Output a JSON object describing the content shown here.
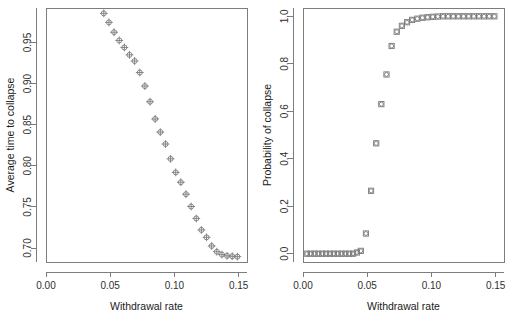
{
  "figure": {
    "name": "two-panel-scatter-figure",
    "background": "#ffffff",
    "marker_color": "#7a7a7a",
    "axis_color": "#7d7d7d",
    "text_color": "#1a1a1a"
  },
  "panels": [
    {
      "id": "left",
      "name": "average-time-to-collapse-panel",
      "xlabel": "Withdrawal rate",
      "ylabel": "Average time to collapse",
      "xticks": [
        "0.00",
        "0.05",
        "0.10",
        "0.15"
      ],
      "yticks": [
        "0.70",
        "0.75",
        "0.80",
        "0.85",
        "0.90",
        "0.95"
      ]
    },
    {
      "id": "right",
      "name": "probability-of-collapse-panel",
      "xlabel": "Withdrawal rate",
      "ylabel": "Probability of collapse",
      "xticks": [
        "0.00",
        "0.05",
        "0.10",
        "0.15"
      ],
      "yticks": [
        "0.0",
        "0.2",
        "0.4",
        "0.6",
        "0.8",
        "1.0"
      ]
    }
  ],
  "chart_data": [
    {
      "type": "scatter",
      "panel": "left",
      "title": "",
      "xlabel": "Withdrawal rate",
      "ylabel": "Average time to collapse",
      "xlim": [
        0.0,
        0.1565
      ],
      "ylim": [
        0.683,
        0.992
      ],
      "xticks": [
        0.0,
        0.05,
        0.1,
        0.15
      ],
      "yticks": [
        0.7,
        0.75,
        0.8,
        0.85,
        0.9,
        0.95
      ],
      "xtick_labels": [
        "0.00",
        "0.05",
        "0.10",
        "0.15"
      ],
      "ytick_labels": [
        "0.70",
        "0.75",
        "0.80",
        "0.85",
        "0.90",
        "0.95"
      ],
      "grid": false,
      "legend": null,
      "marker": "circle-plus",
      "x": [
        0.045,
        0.049,
        0.053,
        0.057,
        0.061,
        0.065,
        0.069,
        0.073,
        0.077,
        0.081,
        0.085,
        0.089,
        0.093,
        0.097,
        0.101,
        0.105,
        0.109,
        0.113,
        0.117,
        0.121,
        0.125,
        0.129,
        0.133,
        0.137,
        0.141,
        0.145,
        0.149
      ],
      "y": [
        0.9855,
        0.9745,
        0.9625,
        0.9525,
        0.944,
        0.935,
        0.9275,
        0.9135,
        0.897,
        0.878,
        0.857,
        0.841,
        0.8265,
        0.8085,
        0.792,
        0.78,
        0.7655,
        0.7505,
        0.736,
        0.722,
        0.713,
        0.7025,
        0.6955,
        0.692,
        0.6905,
        0.69,
        0.6895
      ]
    },
    {
      "type": "scatter",
      "panel": "right",
      "title": "",
      "xlabel": "Withdrawal rate",
      "ylabel": "Probability of collapse",
      "xlim": [
        0.0,
        0.1565
      ],
      "ylim": [
        -0.035,
        1.035
      ],
      "xticks": [
        0.0,
        0.05,
        0.1,
        0.15
      ],
      "yticks": [
        0.0,
        0.2,
        0.4,
        0.6,
        0.8,
        1.0
      ],
      "xtick_labels": [
        "0.00",
        "0.05",
        "0.10",
        "0.15"
      ],
      "ytick_labels": [
        "0.0",
        "0.2",
        "0.4",
        "0.6",
        "0.8",
        "1.0"
      ],
      "grid": false,
      "legend": null,
      "marker": "square-circle",
      "x": [
        0.003,
        0.006,
        0.009,
        0.012,
        0.015,
        0.018,
        0.021,
        0.024,
        0.027,
        0.03,
        0.033,
        0.036,
        0.039,
        0.042,
        0.045,
        0.049,
        0.053,
        0.057,
        0.061,
        0.065,
        0.069,
        0.073,
        0.077,
        0.081,
        0.085,
        0.089,
        0.093,
        0.097,
        0.101,
        0.105,
        0.109,
        0.113,
        0.117,
        0.121,
        0.125,
        0.129,
        0.133,
        0.137,
        0.141,
        0.145,
        0.149
      ],
      "y": [
        0.0,
        0.0,
        0.0,
        0.0,
        0.0,
        0.0,
        0.0,
        0.0,
        0.0,
        0.0,
        0.0,
        0.0,
        0.0,
        0.005,
        0.012,
        0.085,
        0.265,
        0.465,
        0.63,
        0.755,
        0.875,
        0.935,
        0.96,
        0.975,
        0.985,
        0.99,
        0.994,
        0.996,
        0.998,
        0.999,
        1.0,
        1.0,
        1.0,
        1.0,
        1.0,
        1.0,
        1.0,
        1.0,
        1.0,
        1.0,
        1.0
      ]
    }
  ]
}
